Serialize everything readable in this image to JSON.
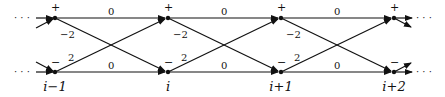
{
  "diagram": {
    "type": "trellis",
    "states": [
      "+",
      "-"
    ],
    "stages": [
      {
        "label": "i−1",
        "top_sign": "+",
        "bottom_sign": "−"
      },
      {
        "label": "i",
        "top_sign": "+",
        "bottom_sign": "−"
      },
      {
        "label": "i+1",
        "top_sign": "+",
        "bottom_sign": "−"
      },
      {
        "label": "i+2",
        "top_sign": "+",
        "bottom_sign": "−"
      }
    ],
    "branch_labels": {
      "top_straight": "0",
      "bottom_straight": "0",
      "top_to_bottom": "−2",
      "bottom_to_top": "2"
    },
    "ellipsis": "· · ·",
    "colors": {
      "line": "#111111",
      "background": "#ffffff"
    }
  }
}
